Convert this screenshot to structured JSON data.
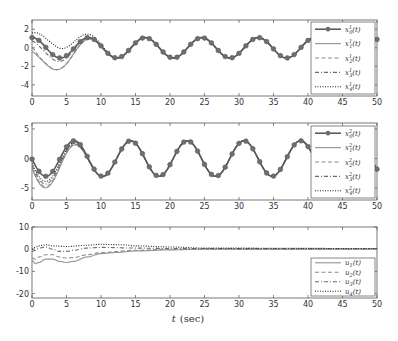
{
  "chart_data": [
    {
      "type": "line",
      "panel": "top",
      "title": "",
      "xlabel": "",
      "ylabel": "",
      "xlim": [
        0,
        50
      ],
      "ylim": [
        -5.2,
        3
      ],
      "xticks": [
        0,
        5,
        10,
        15,
        20,
        25,
        30,
        35,
        40,
        45,
        50
      ],
      "yticks": [
        2,
        0,
        -2,
        -4
      ],
      "grid": false,
      "legend_position": "upper right",
      "series": [
        {
          "name": "x_0^1(t)",
          "style": "solid-marker",
          "color": "#5a5a5a",
          "model": {
            "amp": 1.1,
            "period": 8.2,
            "phase": 0.0,
            "offset": 0,
            "init": 0.0,
            "decay": 1.0
          }
        },
        {
          "name": "x_1^1(t)",
          "style": "solid",
          "color": "#9a9a9a",
          "model": {
            "amp": 1.1,
            "period": 8.2,
            "phase": 0.0,
            "offset": 0,
            "init": -4.2,
            "decay": 3.2,
            "start": 0.0
          }
        },
        {
          "name": "x_2^1(t)",
          "style": "dashed",
          "color": "#8a8a8a",
          "model": {
            "amp": 1.1,
            "period": 8.2,
            "phase": 0.0,
            "offset": 0,
            "init": -3.0,
            "decay": 3.3,
            "start": 1.0
          }
        },
        {
          "name": "x_3^1(t)",
          "style": "dashdot",
          "color": "#6a6a6a",
          "model": {
            "amp": 1.1,
            "period": 8.2,
            "phase": 0.0,
            "offset": 0,
            "init": -1.0,
            "decay": 3.0,
            "start": 1.0
          }
        },
        {
          "name": "x_4^1(t)",
          "style": "dotted",
          "color": "#222222",
          "model": {
            "amp": 1.1,
            "period": 8.2,
            "phase": 0.0,
            "offset": 0,
            "init": 1.4,
            "decay": 4.5,
            "start": 3.0
          }
        }
      ],
      "observed_values": {
        "x_0^1_peaks": [
          [
            0,
            1.0
          ],
          [
            8.5,
            1.2
          ],
          [
            16.5,
            1.1
          ],
          [
            24.7,
            1.1
          ],
          [
            33,
            1.1
          ],
          [
            41,
            1.1
          ],
          [
            50,
            1.0
          ]
        ],
        "x_0^1_troughs": [
          [
            4.2,
            -1.0
          ],
          [
            12.5,
            -1.0
          ],
          [
            20.7,
            -1.0
          ],
          [
            29,
            -1.1
          ],
          [
            37,
            -1.1
          ]
        ],
        "x_1^1_min": [
          4.0,
          -5.0
        ],
        "x_2^1_min": [
          4.0,
          -4.0
        ],
        "x_3^1_min": [
          4.0,
          -2.0
        ],
        "x_4^1_max": [
          8.5,
          2.5
        ]
      }
    },
    {
      "type": "line",
      "panel": "middle",
      "title": "",
      "xlabel": "",
      "ylabel": "",
      "xlim": [
        0,
        50
      ],
      "ylim": [
        -7,
        6
      ],
      "xticks": [
        0,
        5,
        10,
        15,
        20,
        25,
        30,
        35,
        40,
        45,
        50
      ],
      "yticks": [
        5,
        0,
        -5
      ],
      "grid": false,
      "legend_position": "lower right",
      "series": [
        {
          "name": "x_0^2(t)",
          "style": "solid-marker",
          "color": "#5a5a5a",
          "model": {
            "amp": 3.0,
            "period": 8.2,
            "phase": 1.6,
            "offset": 0,
            "init": 0,
            "decay": 1.0
          }
        },
        {
          "name": "x_1^2(t)",
          "style": "solid",
          "color": "#9a9a9a",
          "model": {
            "amp": 3.0,
            "period": 8.2,
            "phase": 1.6,
            "offset": 0,
            "init": -4.5,
            "decay": 3.5,
            "start": 0.0
          }
        },
        {
          "name": "x_2^2(t)",
          "style": "dashed",
          "color": "#8a8a8a",
          "model": {
            "amp": 3.0,
            "period": 8.2,
            "phase": 1.6,
            "offset": 0,
            "init": -4.0,
            "decay": 3.5,
            "start": 0.0
          }
        },
        {
          "name": "x_3^2(t)",
          "style": "dashdot",
          "color": "#6a6a6a",
          "model": {
            "amp": 3.0,
            "period": 8.2,
            "phase": 1.6,
            "offset": 0,
            "init": -3.0,
            "decay": 3.4,
            "start": 0.0
          }
        },
        {
          "name": "x_4^2(t)",
          "style": "dotted",
          "color": "#222222",
          "model": {
            "amp": 3.0,
            "period": 8.2,
            "phase": 1.6,
            "offset": 0,
            "init": -2.0,
            "decay": 3.4,
            "start": 0.0
          }
        }
      ],
      "observed_values": {
        "x_0^2_peaks": [
          [
            6.3,
            2.5
          ],
          [
            14.5,
            3.0
          ],
          [
            22.7,
            3.0
          ],
          [
            31,
            3.0
          ],
          [
            39,
            3.0
          ],
          [
            47.5,
            3.0
          ]
        ],
        "x_0^2_troughs": [
          [
            2,
            -2.8
          ],
          [
            10.5,
            -2.8
          ],
          [
            18.7,
            -2.8
          ],
          [
            27,
            -2.8
          ],
          [
            35,
            -2.8
          ],
          [
            43,
            -2.8
          ]
        ],
        "x_1^2_min": [
          2.0,
          -6.8
        ],
        "x_1^2_max": [
          6.0,
          5.8
        ]
      }
    },
    {
      "type": "line",
      "panel": "bottom",
      "title": "",
      "xlabel": "t (sec)",
      "ylabel": "",
      "xlim": [
        0,
        50
      ],
      "ylim": [
        -22,
        10
      ],
      "xticks": [
        0,
        5,
        10,
        15,
        20,
        25,
        30,
        35,
        40,
        45,
        50
      ],
      "yticks": [
        10,
        0,
        -10,
        -20
      ],
      "grid": false,
      "legend_position": "lower right",
      "series": [
        {
          "name": "u_1(t)",
          "style": "solid",
          "color": "#9a9a9a",
          "points": [
            [
              0,
              -5
            ],
            [
              0.5,
              -6.5
            ],
            [
              1,
              -6
            ],
            [
              2,
              -4.5
            ],
            [
              3,
              -4.5
            ],
            [
              4,
              -5.5
            ],
            [
              5,
              -6
            ],
            [
              6,
              -5.5
            ],
            [
              8,
              -3.5
            ],
            [
              10,
              -2
            ],
            [
              12,
              -1.5
            ],
            [
              15,
              -0.8
            ],
            [
              20,
              -0.3
            ],
            [
              25,
              0
            ],
            [
              50,
              0
            ]
          ]
        },
        {
          "name": "u_2(t)",
          "style": "dashed",
          "color": "#8a8a8a",
          "points": [
            [
              0,
              -4
            ],
            [
              0.5,
              -4.5
            ],
            [
              1,
              -3.5
            ],
            [
              2,
              -2.5
            ],
            [
              3,
              -2.5
            ],
            [
              4,
              -3.5
            ],
            [
              5,
              -4
            ],
            [
              6,
              -3.8
            ],
            [
              8,
              -2.5
            ],
            [
              10,
              -1.5
            ],
            [
              15,
              -0.5
            ],
            [
              20,
              0
            ],
            [
              50,
              0
            ]
          ]
        },
        {
          "name": "u_3(t)",
          "style": "dashdot",
          "color": "#6a6a6a",
          "points": [
            [
              0,
              -1
            ],
            [
              0.5,
              -0.5
            ],
            [
              1,
              0.5
            ],
            [
              2,
              1
            ],
            [
              3,
              0
            ],
            [
              4,
              -1
            ],
            [
              5,
              -1
            ],
            [
              6,
              -0.5
            ],
            [
              8,
              0.5
            ],
            [
              10,
              0.8
            ],
            [
              15,
              0.5
            ],
            [
              20,
              0.3
            ],
            [
              50,
              0.2
            ]
          ]
        },
        {
          "name": "u_4(t)",
          "style": "dotted",
          "color": "#222222",
          "points": [
            [
              0,
              0
            ],
            [
              0.5,
              0.8
            ],
            [
              1,
              1.5
            ],
            [
              2,
              2
            ],
            [
              3,
              1.5
            ],
            [
              5,
              1.2
            ],
            [
              8,
              1.8
            ],
            [
              10,
              2.2
            ],
            [
              13,
              2
            ],
            [
              15,
              1.5
            ],
            [
              20,
              1
            ],
            [
              25,
              0.5
            ],
            [
              50,
              0.3
            ]
          ]
        }
      ]
    }
  ],
  "axes_labels": {
    "xticks": [
      "0",
      "5",
      "10",
      "15",
      "20",
      "25",
      "30",
      "35",
      "40",
      "45",
      "50"
    ],
    "top_yticks": [
      "2",
      "0",
      "-2",
      "-4"
    ],
    "middle_yticks": [
      "5",
      "0",
      "-5"
    ],
    "bottom_yticks": [
      "10",
      "0",
      "-10",
      "-20"
    ],
    "xlabel_italic": "t",
    "xlabel_unit": "(sec)"
  },
  "legends": {
    "top": [
      "x",
      "x",
      "x",
      "x",
      "x"
    ],
    "top_sub": [
      "0",
      "1",
      "2",
      "3",
      "4"
    ],
    "top_sup": [
      "1",
      "1",
      "1",
      "1",
      "1"
    ],
    "middle_sub": [
      "0",
      "1",
      "2",
      "3",
      "4"
    ],
    "middle_sup": [
      "2",
      "2",
      "2",
      "2",
      "2"
    ],
    "bottom": [
      "u",
      "u",
      "u",
      "u"
    ],
    "bottom_sub": [
      "1",
      "2",
      "3",
      "4"
    ]
  },
  "colors": {
    "axis": "#555555",
    "leader": "#5a5a5a",
    "marker": "#6e6e6e",
    "solid": "#9a9a9a",
    "dashed": "#8a8a8a",
    "dashdot": "#6a6a6a",
    "dotted": "#222222"
  }
}
